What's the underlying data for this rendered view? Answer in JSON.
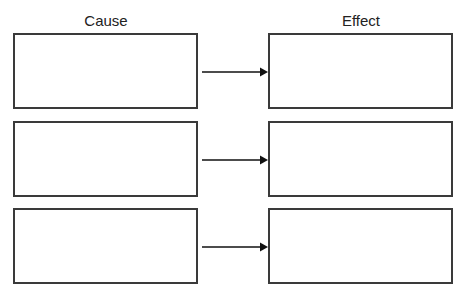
{
  "headers": {
    "cause": "Cause",
    "effect": "Effect"
  },
  "rows": [
    {
      "cause_text": "",
      "effect_text": "",
      "arrow_icon": "right-arrow-icon"
    },
    {
      "cause_text": "",
      "effect_text": "",
      "arrow_icon": "right-arrow-icon"
    },
    {
      "cause_text": "",
      "effect_text": "",
      "arrow_icon": "right-arrow-icon"
    }
  ],
  "colors": {
    "border": "#3a3a3a",
    "arrow": "#111111",
    "text": "#222222",
    "background": "#ffffff"
  }
}
